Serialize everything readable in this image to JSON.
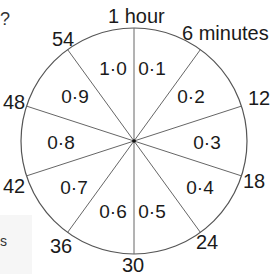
{
  "diagram": {
    "type": "clock-dial-conversion",
    "title_top": "1 hour",
    "title_top_right": "6 minutes",
    "circle": {
      "cx": 134,
      "cy": 141,
      "r": 113,
      "stroke": "#555555"
    },
    "minute_labels": [
      {
        "text": "12",
        "x": 248,
        "y": 88
      },
      {
        "text": "18",
        "x": 243,
        "y": 171
      },
      {
        "text": "24",
        "x": 196,
        "y": 232
      },
      {
        "text": "30",
        "x": 122,
        "y": 255
      },
      {
        "text": "36",
        "x": 50,
        "y": 236
      },
      {
        "text": "42",
        "x": 3,
        "y": 176
      },
      {
        "text": "48",
        "x": 3,
        "y": 92
      },
      {
        "text": "54",
        "x": 52,
        "y": 29
      }
    ],
    "segments": [
      {
        "text": "0·1",
        "x": 152,
        "y": 68
      },
      {
        "text": "0·2",
        "x": 191,
        "y": 96
      },
      {
        "text": "0·3",
        "x": 207,
        "y": 142
      },
      {
        "text": "0·4",
        "x": 200,
        "y": 187
      },
      {
        "text": "0·5",
        "x": 152,
        "y": 211
      },
      {
        "text": "0·6",
        "x": 113,
        "y": 211
      },
      {
        "text": "0·7",
        "x": 74,
        "y": 187
      },
      {
        "text": "0·8",
        "x": 61,
        "y": 142
      },
      {
        "text": "0·9",
        "x": 75,
        "y": 96
      },
      {
        "text": "1·0",
        "x": 113,
        "y": 68
      }
    ],
    "edge_fragments": [
      {
        "text": "?",
        "x": 0,
        "y": 10
      },
      {
        "text": "s",
        "x": 0,
        "y": 236
      }
    ]
  }
}
